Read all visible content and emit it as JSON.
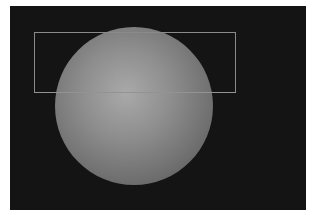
{
  "viewport": {
    "background": "#141414",
    "object": {
      "type": "sphere",
      "label": "sphere",
      "center": [
        134,
        104
      ],
      "radius": 79
    },
    "selection_rectangle": {
      "label": "selection",
      "x": 34,
      "y": 32,
      "width": 202,
      "height": 61,
      "color": "#8a8a8a"
    }
  }
}
